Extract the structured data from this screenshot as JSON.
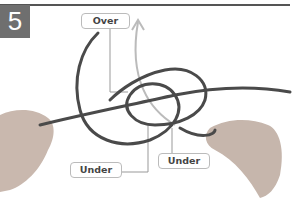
{
  "step": {
    "number": "5"
  },
  "labels": {
    "over": "Over",
    "under_left": "Under",
    "under_right": "Under"
  },
  "colors": {
    "rope": "#4a4a4a",
    "arrow": "#b8b8b8",
    "step_badge": "#6f6f6f",
    "leader_line": "#999999"
  }
}
